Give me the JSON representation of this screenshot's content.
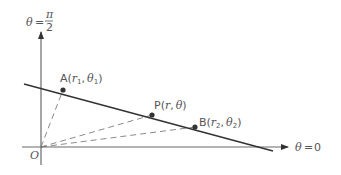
{
  "diagram": {
    "colors": {
      "axis": "#6a6a6a",
      "line": "#333333",
      "dashed": "#8a8a8a",
      "point": "#333333",
      "label": "#555555"
    },
    "axes": {
      "vertical_label": {
        "theta": "θ",
        "equals": "=",
        "numerator": "π",
        "denominator": "2"
      },
      "horizontal_label": {
        "theta": "θ",
        "equals": "=",
        "value": "0"
      },
      "origin_label": "O"
    },
    "points": [
      {
        "id": "A",
        "letter": "A",
        "open": "(",
        "r": "r",
        "r_sub": "1",
        "comma": ",",
        "theta": "θ",
        "theta_sub": "1",
        "close": ")"
      },
      {
        "id": "P",
        "letter": "P",
        "open": "(",
        "r": "r",
        "r_sub": "",
        "comma": ",",
        "theta": "θ",
        "theta_sub": "",
        "close": ")"
      },
      {
        "id": "B",
        "letter": "B",
        "open": "(",
        "r": "r",
        "r_sub": "2",
        "comma": ",",
        "theta": "θ",
        "theta_sub": "2",
        "close": ")"
      }
    ]
  }
}
